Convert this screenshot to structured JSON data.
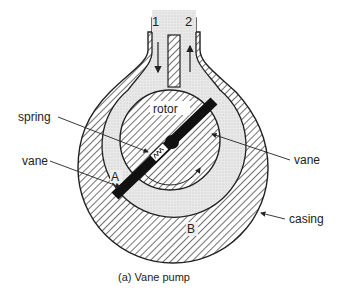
{
  "diagram": {
    "caption": "(a)  Vane pump",
    "ports": {
      "inlet": "1",
      "outlet": "2"
    },
    "labels": {
      "spring": "spring",
      "rotor": "rotor",
      "vane_left": "vane",
      "vane_right": "vane",
      "chamber_a": "A",
      "chamber_b": "B",
      "casing": "casing"
    },
    "colors": {
      "line": "#222222",
      "hatch": "#333333",
      "fluid": "#e6e6e6",
      "vane": "#111111"
    }
  }
}
